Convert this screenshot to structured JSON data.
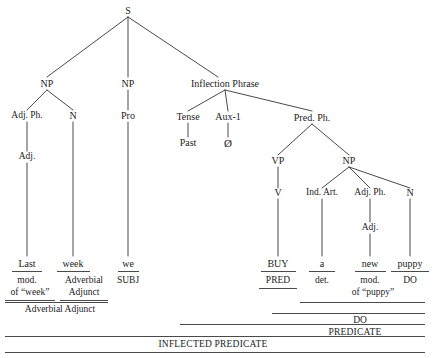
{
  "diagram": {
    "background": "#ffffff",
    "line_color": "#4a4a4a",
    "text_color": "#1c1c1c"
  },
  "nodes": {
    "root": "S",
    "np_adverbial": "NP",
    "adj_ph_left": "Adj. Ph.",
    "adj_left": "Adj.",
    "n_left": "N",
    "np_subject": "NP",
    "pro": "Pro",
    "inflection_phrase": "Inflection Phrase",
    "tense": "Tense",
    "past": "Past",
    "aux1": "Aux-1",
    "aux1_value": "Ø",
    "pred_ph": "Pred. Ph.",
    "vp": "VP",
    "v": "V",
    "np_object": "NP",
    "ind_art": "Ind. Art.",
    "adj_ph_right": "Adj. Ph.",
    "adj_right": "Adj.",
    "n_right": "N"
  },
  "words": {
    "last": "Last",
    "week": "week",
    "we": "we",
    "buy": "BUY",
    "a": "a",
    "new": "new",
    "puppy": "puppy"
  },
  "functions": {
    "mod_of_week_line1": "mod.",
    "mod_of_week_line2": "of “week”",
    "adverbial_adjunct_line1": "Adverbial",
    "adverbial_adjunct_line2": "Adjunct",
    "subj": "SUBJ",
    "pred": "PRED",
    "det": "det.",
    "mod_of_puppy_line1": "mod.",
    "mod_of_puppy_line2": "of “puppy”",
    "do_noun": "DO"
  },
  "brackets": {
    "adverbial_adjunct": "Adverbial Adjunct",
    "direct_object": "DO",
    "predicate": "PREDICATE",
    "inflected_predicate": "INFLECTED PREDICATE"
  }
}
